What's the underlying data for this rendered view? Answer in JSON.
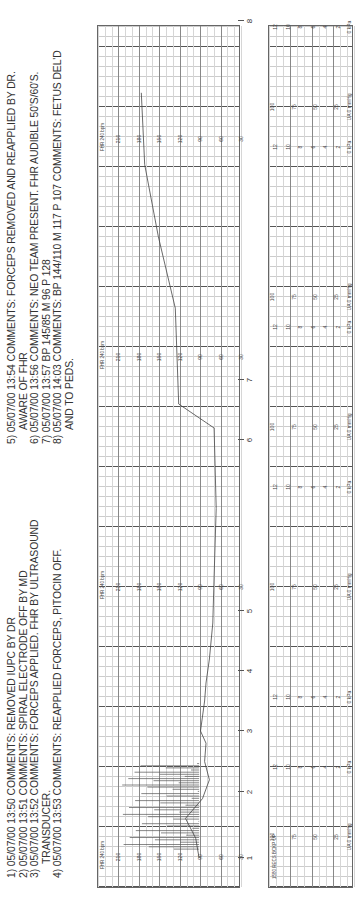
{
  "notes": {
    "left": [
      {
        "text": "1) 05/07/00 13:50 COMMENTS: REMOVED IUPC BY DR",
        "indent": false
      },
      {
        "text": "2) 05/07/00 13:51 COMMENTS: SPIRAL ELECTRODE OFF BY MD",
        "indent": false
      },
      {
        "text": "3) 05/07/00 13:52 COMMENTS: FORCEPS APPLIED. FHR BY ULTRASOUND",
        "indent": false
      },
      {
        "text": "TRANSDUCER.",
        "indent": true
      },
      {
        "text": "4) 05/07/00 13:53 COMMENTS: REAPPLIED FORCEPS, PITOCIN OFF.",
        "indent": false
      }
    ],
    "right": [
      {
        "text": "5) 05/07/00 13:54 COMMENTS: FORCEPS REMOVED AND REAPPLIED BY DR.",
        "indent": false
      },
      {
        "text": "AWARE OF FHR",
        "indent": true
      },
      {
        "text": "6) 05/07/00 13:56 COMMENTS: NEO TEAM PRESENT. FHR AUDIBLE 50'S/60'S.",
        "indent": false
      },
      {
        "text": "7) 05/07/00 13:57 BP 145/85 M 96 P 128",
        "indent": false
      },
      {
        "text": "8) 05/07/00 14:03 COMMENTS: BP 144/110 M 117 P 107 COMMENTS: FETUS DEL'D",
        "indent": false
      },
      {
        "text": "AND TO PEDS.",
        "indent": true
      }
    ]
  },
  "fhr": {
    "title": "FHR 240 bpm",
    "scale_labels": [
      "210",
      "180",
      "150",
      "120",
      "90",
      "60",
      "30"
    ],
    "label_blocks_x": [
      30,
      300,
      530,
      748
    ]
  },
  "ua": {
    "title": "1580 RECS BCKP UP",
    "mmhg_labels": [
      "100",
      "75",
      "50",
      "25"
    ],
    "mmhg_unit": "UA 0 mmHg",
    "kpa_labels": [
      "12",
      "10",
      "8",
      "6",
      "4",
      "2"
    ],
    "kpa_unit": "0 kPa",
    "mmhg_blocks_x": [
      50,
      300,
      460,
      590,
      780
    ],
    "kpa_blocks_x": [
      120,
      190,
      400,
      560,
      740,
      860
    ]
  },
  "page_ticks": [
    {
      "label": "1",
      "x": 30
    },
    {
      "label": "2",
      "x": 96
    },
    {
      "label": "3",
      "x": 157
    },
    {
      "label": "4",
      "x": 217
    },
    {
      "label": "5",
      "x": 277
    },
    {
      "label": "6",
      "x": 448
    },
    {
      "label": "7",
      "x": 508
    },
    {
      "label": "8",
      "x": 867
    }
  ],
  "chart_data": {
    "type": "line",
    "annotations": [
      "1) 05/07/00 13:50 COMMENTS: REMOVED IUPC BY DR",
      "2) 05/07/00 13:51 COMMENTS: SPIRAL ELECTRODE OFF BY MD",
      "3) 05/07/00 13:52 COMMENTS: FORCEPS APPLIED. FHR BY ULTRASOUND TRANSDUCER.",
      "4) 05/07/00 13:53 COMMENTS: REAPPLIED FORCEPS, PITOCIN OFF.",
      "5) 05/07/00 13:54 COMMENTS: FORCEPS REMOVED AND REAPPLIED BY DR. AWARE OF FHR",
      "6) 05/07/00 13:56 COMMENTS: NEO TEAM PRESENT. FHR AUDIBLE 50'S/60'S.",
      "7) 05/07/00 13:57 BP 145/85 M 96 P 128",
      "8) 05/07/00 14:03 COMMENTS: BP 144/110 M 117 P 107 COMMENTS: FETUS DEL'D AND TO PEDS."
    ],
    "series": [
      {
        "name": "FHR (bpm)",
        "x": [
          1.0,
          1.3,
          1.6,
          1.9,
          2.2,
          2.5,
          2.8,
          3.0,
          3.5,
          3.8,
          4.2,
          4.8,
          5.2,
          5.6,
          6.2,
          6.6,
          7.2,
          7.4,
          7.6,
          7.8
        ],
        "values": [
          90,
          95,
          110,
          85,
          75,
          82,
          80,
          88,
          82,
          80,
          75,
          70,
          68,
          65,
          68,
          120,
          125,
          150,
          170,
          175
        ]
      }
    ],
    "xlabel": "Page / time marks (1-8)",
    "ylabel": "FHR bpm",
    "ylim": [
      30,
      240
    ],
    "yticks": [
      30,
      60,
      90,
      120,
      150,
      180,
      210
    ],
    "ua_scale_mmHg": [
      0,
      25,
      50,
      75,
      100
    ],
    "ua_scale_kPa": [
      0,
      2,
      4,
      6,
      8,
      10,
      12
    ],
    "grid": true
  }
}
